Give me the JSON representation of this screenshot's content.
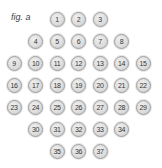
{
  "figure": {
    "label": "fig. a",
    "ball_color": "#d9d9d9",
    "ball_border": "#9a9a9a",
    "rows": [
      {
        "cols": [
          2,
          3,
          4
        ],
        "numbers": [
          "1",
          "2",
          "3"
        ]
      },
      {
        "cols": [
          1,
          2,
          3,
          4,
          5
        ],
        "numbers": [
          "4",
          "5",
          "6",
          "7",
          "8"
        ]
      },
      {
        "cols": [
          0,
          1,
          2,
          3,
          4,
          5,
          6
        ],
        "numbers": [
          "9",
          "10",
          "11",
          "12",
          "13",
          "14",
          "15"
        ]
      },
      {
        "cols": [
          0,
          1,
          2,
          3,
          4,
          5,
          6
        ],
        "numbers": [
          "16",
          "17",
          "18",
          "19",
          "20",
          "21",
          "22"
        ]
      },
      {
        "cols": [
          0,
          1,
          2,
          3,
          4,
          5,
          6
        ],
        "numbers": [
          "23",
          "24",
          "25",
          "26",
          "27",
          "28",
          "29"
        ]
      },
      {
        "cols": [
          1,
          2,
          3,
          4,
          5
        ],
        "numbers": [
          "30",
          "31",
          "32",
          "33",
          "34"
        ]
      },
      {
        "cols": [
          2,
          3,
          4
        ],
        "numbers": [
          "35",
          "36",
          "37"
        ]
      }
    ]
  }
}
